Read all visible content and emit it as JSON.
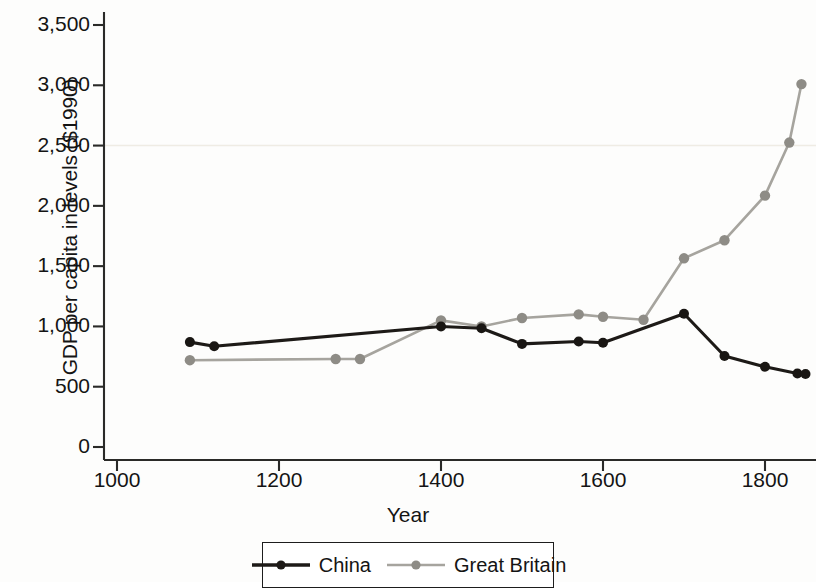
{
  "chart_data": {
    "type": "line",
    "title": "",
    "xlabel": "Year",
    "ylabel": "GDP per capita in levels ($1990)",
    "xlim": [
      1000,
      1870
    ],
    "ylim": [
      0,
      3600
    ],
    "xticks": [
      "1000",
      "1200",
      "1400",
      "1600",
      "1800"
    ],
    "xtick_values": [
      1000,
      1200,
      1400,
      1600,
      1800
    ],
    "yticks": [
      "0",
      "500",
      "1,000",
      "1,500",
      "2,000",
      "2,500",
      "3,000",
      "3,500"
    ],
    "ytick_values": [
      0,
      500,
      1000,
      1500,
      2000,
      2500,
      3000,
      3500
    ],
    "grid": "single faint horizontal line at 2,500",
    "legend_position": "bottom-center, boxed",
    "series": [
      {
        "name": "China",
        "color": "#1d1a17",
        "marker": "filled-circle",
        "linestyle": "solid",
        "x": [
          1090,
          1120,
          1400,
          1450,
          1500,
          1570,
          1600,
          1700,
          1750,
          1800,
          1840,
          1850
        ],
        "values": [
          870,
          835,
          1000,
          985,
          855,
          875,
          865,
          1105,
          755,
          665,
          610,
          605
        ]
      },
      {
        "name": "Great Britain",
        "color": "#999791",
        "marker": "filled-circle",
        "linestyle": "solid-light",
        "x": [
          1090,
          1270,
          1300,
          1400,
          1450,
          1500,
          1570,
          1600,
          1650,
          1700,
          1750,
          1800,
          1830,
          1845
        ],
        "values": [
          720,
          730,
          730,
          1050,
          1000,
          1070,
          1100,
          1080,
          1055,
          1565,
          1715,
          2085,
          2525,
          3010
        ]
      }
    ]
  },
  "legend": {
    "entries": [
      {
        "label": "China"
      },
      {
        "label": "Great Britain"
      }
    ]
  },
  "axis": {
    "axis_color": "#2a2a28",
    "gridline_color": "#efece4"
  }
}
